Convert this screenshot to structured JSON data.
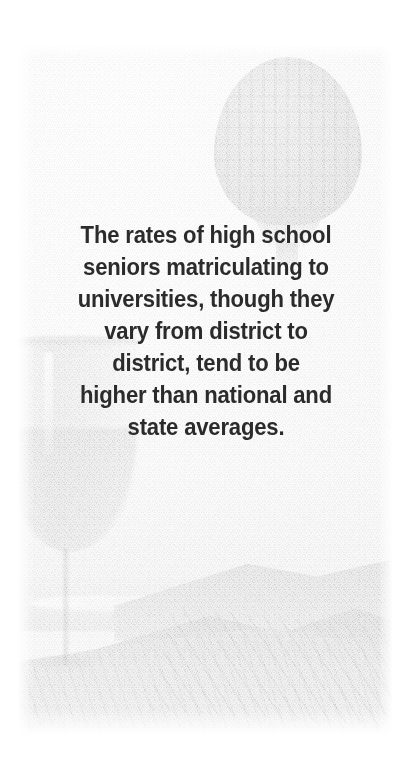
{
  "page": {
    "background_color": "#ffffff",
    "width": 412,
    "height": 767
  },
  "photo": {
    "style": "faded high-key photo montage on textured paper",
    "edge_treatment": "soft white vignette fade",
    "base_color": "#fafafa",
    "elements": [
      {
        "name": "hot-air-balloon",
        "position": "upper-right",
        "tone": "#b8b8b8"
      },
      {
        "name": "wine-glass",
        "position": "left-edge-cropped",
        "tone": "#c0c0c0"
      },
      {
        "name": "coastal-mountain-landscape",
        "position": "lower",
        "tone": "#c8c8c8"
      }
    ]
  },
  "quote": {
    "text": "The rates of high school\nseniors matriculating to\nuniversities, though they\nvary from district to\ndistrict, tend to be\nhigher than national and\nstate averages.",
    "lines": [
      "The rates of high school",
      "seniors matriculating to",
      "universities, though they",
      "vary from district to",
      "district, tend to be",
      "higher than national and",
      "state averages."
    ],
    "color": "#2b2b2b",
    "align": "center"
  }
}
